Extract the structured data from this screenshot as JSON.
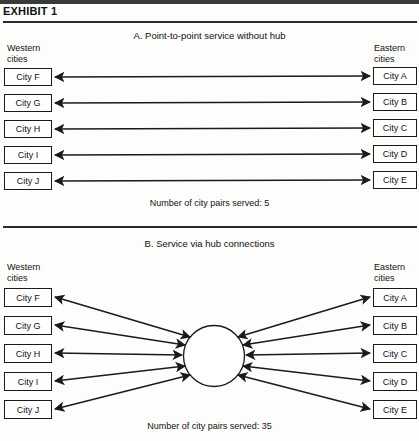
{
  "exhibit": {
    "title": "EXHIBIT 1"
  },
  "panels": [
    {
      "id": "panel-a",
      "title": "A.  Point-to-point service without hub",
      "west_label": "Western\ncities",
      "east_label": "Eastern\ncities",
      "west_cities": [
        "City F",
        "City G",
        "City H",
        "City I",
        "City J"
      ],
      "east_cities": [
        "City A",
        "City B",
        "City C",
        "City D",
        "City E"
      ],
      "count_label": "Number of city pairs served: 5",
      "pairs_served": 5,
      "topology": "point-to-point"
    },
    {
      "id": "panel-b",
      "title": "B.  Service via hub connections",
      "west_label": "Western\ncities",
      "east_label": "Eastern\ncities",
      "west_cities": [
        "City F",
        "City G",
        "City H",
        "City I",
        "City J"
      ],
      "east_cities": [
        "City A",
        "City B",
        "City C",
        "City D",
        "City E"
      ],
      "hub_label": "HUB",
      "count_label": "Number of city pairs served: 35",
      "pairs_served": 35,
      "topology": "hub-and-spoke"
    }
  ],
  "colors": {
    "ink": "#1a1a1a",
    "paper": "#fdfdfc",
    "rule": "#2b2b2b"
  }
}
